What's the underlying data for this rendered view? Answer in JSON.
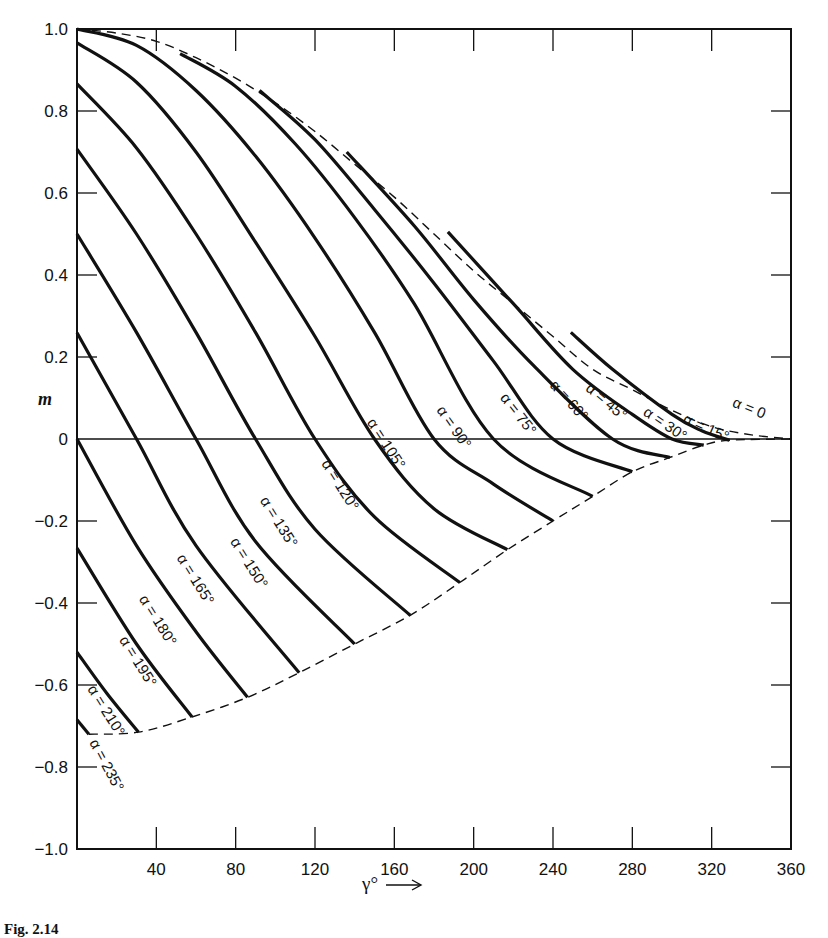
{
  "chart_data": {
    "type": "line",
    "title": "",
    "xlabel": "γ°",
    "ylabel": "m",
    "xlim": [
      0,
      360
    ],
    "ylim": [
      -1.0,
      1.0
    ],
    "grid": false,
    "legend": "inline curve labels",
    "x_ticks": [
      40,
      80,
      120,
      160,
      200,
      240,
      280,
      320,
      360
    ],
    "y_ticks": [
      "1.0",
      "0.8",
      "0.6",
      "0.4",
      "0.2",
      "0",
      "−0.2",
      "−0.4",
      "−0.6",
      "−0.8",
      "−1.0"
    ],
    "y_tick_values": [
      1.0,
      0.8,
      0.6,
      0.4,
      0.2,
      0,
      -0.2,
      -0.4,
      -0.6,
      -0.8,
      -1.0
    ],
    "envelopes": [
      {
        "name": "α = 0",
        "style": "dashed",
        "points": [
          [
            0,
            1.0
          ],
          [
            20,
            0.99
          ],
          [
            40,
            0.97
          ],
          [
            60,
            0.93
          ],
          [
            80,
            0.88
          ],
          [
            100,
            0.82
          ],
          [
            120,
            0.75
          ],
          [
            140,
            0.67
          ],
          [
            160,
            0.59
          ],
          [
            180,
            0.5
          ],
          [
            200,
            0.41
          ],
          [
            220,
            0.33
          ],
          [
            240,
            0.25
          ],
          [
            260,
            0.17
          ],
          [
            280,
            0.12
          ],
          [
            300,
            0.07
          ],
          [
            320,
            0.03
          ],
          [
            340,
            0.01
          ],
          [
            360,
            0
          ]
        ]
      },
      {
        "name": "lower envelope",
        "style": "dashed",
        "points": [
          [
            6,
            -0.72
          ],
          [
            31,
            -0.715
          ],
          [
            58,
            -0.678
          ],
          [
            86,
            -0.63
          ],
          [
            112,
            -0.57
          ],
          [
            140,
            -0.5
          ],
          [
            168,
            -0.43
          ],
          [
            193,
            -0.35
          ],
          [
            217,
            -0.27
          ],
          [
            240,
            -0.2
          ],
          [
            260,
            -0.14
          ],
          [
            280,
            -0.08
          ],
          [
            299,
            -0.045
          ],
          [
            316,
            -0.015
          ],
          [
            329,
            -0.003
          ],
          [
            360,
            0
          ]
        ]
      }
    ],
    "series": [
      {
        "name": "α = 15°",
        "label": "α = 15°",
        "points": [
          [
            249,
            0.26
          ],
          [
            270,
            0.17
          ],
          [
            300,
            0.06
          ],
          [
            315,
            0.02
          ],
          [
            329,
            -0.003
          ]
        ]
      },
      {
        "name": "α = 30°",
        "label": "α = 30°",
        "points": [
          [
            187,
            0.505
          ],
          [
            220,
            0.33
          ],
          [
            250,
            0.17
          ],
          [
            280,
            0.06
          ],
          [
            300,
            0.0
          ],
          [
            316,
            -0.015
          ]
        ]
      },
      {
        "name": "α = 45°",
        "label": "α = 45°",
        "points": [
          [
            136,
            0.7
          ],
          [
            170,
            0.52
          ],
          [
            200,
            0.34
          ],
          [
            230,
            0.18
          ],
          [
            270,
            0.0
          ],
          [
            299,
            -0.045
          ]
        ]
      },
      {
        "name": "α = 60°",
        "label": "α = 60°",
        "points": [
          [
            92,
            0.85
          ],
          [
            120,
            0.73
          ],
          [
            150,
            0.56
          ],
          [
            180,
            0.38
          ],
          [
            210,
            0.19
          ],
          [
            240,
            0.0
          ],
          [
            280,
            -0.08
          ]
        ]
      },
      {
        "name": "α = 75°",
        "label": "α = 75°",
        "points": [
          [
            52,
            0.94
          ],
          [
            80,
            0.86
          ],
          [
            110,
            0.72
          ],
          [
            140,
            0.54
          ],
          [
            170,
            0.33
          ],
          [
            210,
            0.0
          ],
          [
            260,
            -0.14
          ]
        ]
      },
      {
        "name": "α = 90°",
        "label": "α = 90°",
        "points": [
          [
            0,
            1.0
          ],
          [
            30,
            0.96
          ],
          [
            60,
            0.85
          ],
          [
            90,
            0.69
          ],
          [
            120,
            0.49
          ],
          [
            150,
            0.26
          ],
          [
            180,
            0.0
          ],
          [
            210,
            -0.11
          ],
          [
            240,
            -0.2
          ]
        ]
      },
      {
        "name": "α = 105°",
        "label": "α = 105°",
        "points": [
          [
            0,
            0.966
          ],
          [
            30,
            0.87
          ],
          [
            60,
            0.7
          ],
          [
            90,
            0.48
          ],
          [
            120,
            0.25
          ],
          [
            150,
            0.0
          ],
          [
            180,
            -0.17
          ],
          [
            217,
            -0.27
          ]
        ]
      },
      {
        "name": "α = 120°",
        "label": "α = 120°",
        "points": [
          [
            0,
            0.866
          ],
          [
            30,
            0.71
          ],
          [
            60,
            0.5
          ],
          [
            90,
            0.26
          ],
          [
            120,
            0.0
          ],
          [
            150,
            -0.19
          ],
          [
            193,
            -0.35
          ]
        ]
      },
      {
        "name": "α = 135°",
        "label": "α = 135°",
        "points": [
          [
            0,
            0.707
          ],
          [
            30,
            0.5
          ],
          [
            60,
            0.26
          ],
          [
            90,
            0.0
          ],
          [
            120,
            -0.22
          ],
          [
            168,
            -0.43
          ]
        ]
      },
      {
        "name": "α = 150°",
        "label": "α = 150°",
        "points": [
          [
            0,
            0.5
          ],
          [
            30,
            0.26
          ],
          [
            60,
            0.0
          ],
          [
            90,
            -0.25
          ],
          [
            140,
            -0.5
          ]
        ]
      },
      {
        "name": "α = 165°",
        "label": "α = 165°",
        "points": [
          [
            0,
            0.259
          ],
          [
            30,
            0.0
          ],
          [
            60,
            -0.26
          ],
          [
            112,
            -0.57
          ]
        ]
      },
      {
        "name": "α = 180°",
        "label": "α = 180°",
        "points": [
          [
            0,
            0.0
          ],
          [
            30,
            -0.26
          ],
          [
            60,
            -0.47
          ],
          [
            86,
            -0.63
          ]
        ]
      },
      {
        "name": "α = 195°",
        "label": "α = 195°",
        "points": [
          [
            0,
            -0.266
          ],
          [
            30,
            -0.5
          ],
          [
            58,
            -0.678
          ]
        ]
      },
      {
        "name": "α = 210°",
        "label": "α = 210°",
        "points": [
          [
            0,
            -0.52
          ],
          [
            15,
            -0.62
          ],
          [
            31,
            -0.715
          ]
        ]
      },
      {
        "name": "α = 235°",
        "label": "α = 235°",
        "points": [
          [
            0,
            -0.685
          ],
          [
            6,
            -0.72
          ]
        ]
      }
    ],
    "annotations": [
      {
        "text": "α = 0",
        "x": 330,
        "y": 0.08,
        "rotate": 22
      },
      {
        "text": "α = 15°",
        "x": 305,
        "y": 0.04,
        "rotate": 24
      },
      {
        "text": "α = 30°",
        "x": 285,
        "y": 0.06,
        "rotate": 34
      },
      {
        "text": "α = 45°",
        "x": 256,
        "y": 0.12,
        "rotate": 40
      },
      {
        "text": "α = 60°",
        "x": 238,
        "y": 0.13,
        "rotate": 48
      },
      {
        "text": "α = 75°",
        "x": 213,
        "y": 0.1,
        "rotate": 52
      },
      {
        "text": "α = 90°",
        "x": 181,
        "y": 0.07,
        "rotate": 55
      },
      {
        "text": "α = 105°",
        "x": 146,
        "y": 0.04,
        "rotate": 57
      },
      {
        "text": "α = 120°",
        "x": 123,
        "y": -0.06,
        "rotate": 58
      },
      {
        "text": "α = 135°",
        "x": 92,
        "y": -0.15,
        "rotate": 58
      },
      {
        "text": "α = 150°",
        "x": 77,
        "y": -0.25,
        "rotate": 58
      },
      {
        "text": "α = 165°",
        "x": 50,
        "y": -0.29,
        "rotate": 58
      },
      {
        "text": "α = 180°",
        "x": 31,
        "y": -0.39,
        "rotate": 58
      },
      {
        "text": "α = 195°",
        "x": 21,
        "y": -0.49,
        "rotate": 58
      },
      {
        "text": "α = 210°",
        "x": 5,
        "y": -0.61,
        "rotate": 58
      },
      {
        "text": "α = 235°",
        "x": 6,
        "y": -0.74,
        "rotate": 62
      }
    ]
  },
  "axis": {
    "y_title": "m",
    "x_title": "γ°"
  },
  "caption": "Fig. 2.14"
}
